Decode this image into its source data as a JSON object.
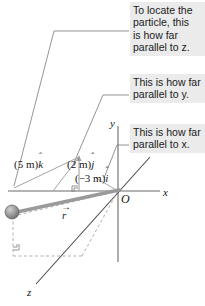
{
  "figure": {
    "colors": {
      "callout_bg": "#ebebeb",
      "text": "#1a1a1a",
      "axis_line": "#555555",
      "thin_line": "#8a8a8a",
      "leader_line": "#7a7a7a",
      "vector_gray": "#9a9a9a",
      "particle_fill": "#8f8f8f",
      "dashed": "#a8a8a8"
    }
  },
  "callouts": [
    {
      "id": "z",
      "text": "To locate the\nparticle, this\nis how far\nparallel to z."
    },
    {
      "id": "y",
      "text": "This is how far\nparallel to y."
    },
    {
      "id": "x",
      "text": "This is how far\nparallel to x."
    }
  ],
  "labels": {
    "component_k_pre": "(5 m)",
    "component_k_unit": "k",
    "component_j_pre": "(2 m)",
    "component_j_unit": "j",
    "component_i_pre": "(−3 m)",
    "component_i_unit": "i",
    "hat": "ˆ",
    "position_vector": "r",
    "vector_arrow": "→",
    "origin": "O",
    "axis_x": "x",
    "axis_y": "y",
    "axis_z": "z"
  }
}
